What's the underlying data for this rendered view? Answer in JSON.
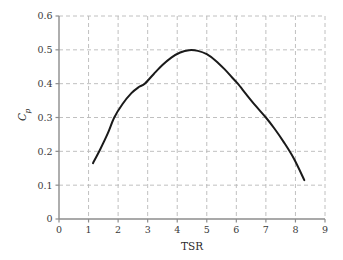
{
  "chart_data": {
    "type": "line",
    "title": "",
    "subtitle": "",
    "xlabel": "TSR",
    "ylabel": "Cp",
    "ylabel_base": "C",
    "ylabel_subscript": "p",
    "xlim": [
      0,
      9
    ],
    "ylim": [
      0,
      0.6
    ],
    "xticks": [
      0,
      1,
      2,
      3,
      4,
      5,
      6,
      7,
      8,
      9
    ],
    "xtick_labels": [
      "0",
      "1",
      "2",
      "3",
      "4",
      "5",
      "6",
      "7",
      "8",
      "9"
    ],
    "yticks": [
      0,
      0.1,
      0.2,
      0.3,
      0.4,
      0.5,
      0.6
    ],
    "ytick_labels": [
      "0",
      "0.1",
      "0.2",
      "0.3",
      "0.4",
      "0.5",
      "0.6"
    ],
    "grid": true,
    "grid_style": "dashed",
    "grid_color": "#b9b9b9",
    "axis_color": "#8c8c8c",
    "legend": null,
    "legend_position": "none",
    "series": [
      {
        "name": "Cp vs TSR",
        "color": "#1a1a1a",
        "line_width": 2.0,
        "x": [
          1.15,
          1.4,
          1.65,
          1.87,
          2.15,
          2.45,
          2.7,
          2.9,
          3.2,
          3.5,
          3.8,
          4.1,
          4.4,
          4.7,
          5.0,
          5.3,
          5.6,
          5.85,
          6.05,
          6.35,
          6.65,
          7.0,
          7.3,
          7.6,
          7.95,
          8.3
        ],
        "y": [
          0.165,
          0.207,
          0.253,
          0.3,
          0.34,
          0.372,
          0.39,
          0.4,
          0.428,
          0.455,
          0.477,
          0.492,
          0.499,
          0.497,
          0.487,
          0.468,
          0.443,
          0.419,
          0.4,
          0.367,
          0.335,
          0.3,
          0.266,
          0.228,
          0.178,
          0.115
        ]
      }
    ],
    "annotations": []
  }
}
